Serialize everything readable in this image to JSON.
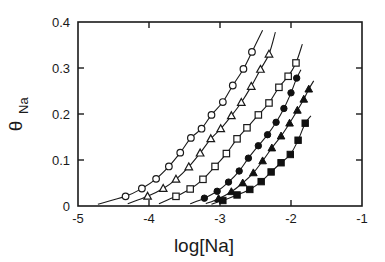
{
  "chart_data": {
    "type": "scatter",
    "title": "",
    "subtitle": "",
    "xlabel": "log[Na]",
    "ylabel": "θ",
    "ylabel_subscript": "Na",
    "xlim": [
      -5,
      -1
    ],
    "ylim": [
      0,
      0.4
    ],
    "xticks": [
      -5,
      -4,
      -3,
      -2,
      -1
    ],
    "xticklabels": [
      "-5",
      "-4",
      "-3",
      "-2",
      "-1"
    ],
    "yticks": [
      0,
      0.1,
      0.2,
      0.3,
      0.4
    ],
    "yticklabels": [
      "0",
      "0.1",
      "0.2",
      "0.3",
      "0.4"
    ],
    "grid": false,
    "legend": "none",
    "tick_direction": "in",
    "frame": "box",
    "series": [
      {
        "name": "series-1",
        "marker": "open-circle",
        "points": [
          {
            "x": -4.33,
            "y": 0.021
          },
          {
            "x": -4.1,
            "y": 0.038
          },
          {
            "x": -3.9,
            "y": 0.059
          },
          {
            "x": -3.72,
            "y": 0.086
          },
          {
            "x": -3.56,
            "y": 0.116
          },
          {
            "x": -3.41,
            "y": 0.148
          },
          {
            "x": -3.26,
            "y": 0.168
          },
          {
            "x": -3.12,
            "y": 0.198
          },
          {
            "x": -2.96,
            "y": 0.226
          },
          {
            "x": -2.82,
            "y": 0.262
          },
          {
            "x": -2.67,
            "y": 0.298
          },
          {
            "x": -2.55,
            "y": 0.335
          }
        ],
        "fit": {
          "x_start": -4.72,
          "x_end": -2.4,
          "y_start": 0.004,
          "y_end": 0.382
        }
      },
      {
        "name": "series-2",
        "marker": "open-triangle",
        "points": [
          {
            "x": -4.02,
            "y": 0.021
          },
          {
            "x": -3.8,
            "y": 0.038
          },
          {
            "x": -3.62,
            "y": 0.058
          },
          {
            "x": -3.44,
            "y": 0.085
          },
          {
            "x": -3.28,
            "y": 0.115
          },
          {
            "x": -3.13,
            "y": 0.146
          },
          {
            "x": -2.99,
            "y": 0.168
          },
          {
            "x": -2.84,
            "y": 0.196
          },
          {
            "x": -2.7,
            "y": 0.225
          },
          {
            "x": -2.56,
            "y": 0.26
          },
          {
            "x": -2.43,
            "y": 0.297
          },
          {
            "x": -2.31,
            "y": 0.33
          }
        ],
        "fit": {
          "x_start": -4.3,
          "x_end": -2.22,
          "y_start": 0.005,
          "y_end": 0.378
        }
      },
      {
        "name": "series-3",
        "marker": "open-square",
        "points": [
          {
            "x": -3.62,
            "y": 0.021
          },
          {
            "x": -3.42,
            "y": 0.037
          },
          {
            "x": -3.24,
            "y": 0.058
          },
          {
            "x": -3.07,
            "y": 0.086
          },
          {
            "x": -2.91,
            "y": 0.114
          },
          {
            "x": -2.76,
            "y": 0.146
          },
          {
            "x": -2.62,
            "y": 0.17
          },
          {
            "x": -2.46,
            "y": 0.198
          },
          {
            "x": -2.31,
            "y": 0.224
          },
          {
            "x": -2.17,
            "y": 0.258
          },
          {
            "x": -2.04,
            "y": 0.282
          },
          {
            "x": -1.93,
            "y": 0.311
          }
        ],
        "fit": {
          "x_start": -3.86,
          "x_end": -1.84,
          "y_start": 0.005,
          "y_end": 0.352
        }
      },
      {
        "name": "series-4",
        "marker": "filled-circle",
        "points": [
          {
            "x": -3.22,
            "y": 0.017
          },
          {
            "x": -3.04,
            "y": 0.032
          },
          {
            "x": -2.88,
            "y": 0.052
          },
          {
            "x": -2.73,
            "y": 0.076
          },
          {
            "x": -2.6,
            "y": 0.104
          },
          {
            "x": -2.46,
            "y": 0.131
          },
          {
            "x": -2.33,
            "y": 0.155
          },
          {
            "x": -2.21,
            "y": 0.182
          },
          {
            "x": -2.1,
            "y": 0.212
          },
          {
            "x": -2.0,
            "y": 0.246
          },
          {
            "x": -1.92,
            "y": 0.278
          }
        ],
        "fit": {
          "x_start": -3.42,
          "x_end": -1.86,
          "y_start": 0.005,
          "y_end": 0.296
        }
      },
      {
        "name": "series-5",
        "marker": "filled-triangle",
        "points": [
          {
            "x": -3.02,
            "y": 0.016
          },
          {
            "x": -2.84,
            "y": 0.031
          },
          {
            "x": -2.68,
            "y": 0.05
          },
          {
            "x": -2.53,
            "y": 0.072
          },
          {
            "x": -2.4,
            "y": 0.098
          },
          {
            "x": -2.27,
            "y": 0.126
          },
          {
            "x": -2.14,
            "y": 0.152
          },
          {
            "x": -2.02,
            "y": 0.18
          },
          {
            "x": -1.91,
            "y": 0.208
          },
          {
            "x": -1.82,
            "y": 0.232
          },
          {
            "x": -1.75,
            "y": 0.254
          }
        ],
        "fit": {
          "x_start": -3.2,
          "x_end": -1.68,
          "y_start": 0.005,
          "y_end": 0.272
        }
      },
      {
        "name": "series-6",
        "marker": "filled-square",
        "points": [
          {
            "x": -2.96,
            "y": 0.012
          },
          {
            "x": -2.76,
            "y": 0.024
          },
          {
            "x": -2.58,
            "y": 0.036
          },
          {
            "x": -2.42,
            "y": 0.053
          },
          {
            "x": -2.28,
            "y": 0.074
          },
          {
            "x": -2.14,
            "y": 0.094
          },
          {
            "x": -2.01,
            "y": 0.112
          },
          {
            "x": -1.9,
            "y": 0.143
          },
          {
            "x": -1.8,
            "y": 0.18
          }
        ],
        "fit": {
          "x_start": -3.12,
          "x_end": -1.72,
          "y_start": 0.004,
          "y_end": 0.196
        }
      }
    ]
  },
  "figure": {
    "background_color": "#ffffff",
    "line_color": "#1a1a1a"
  }
}
